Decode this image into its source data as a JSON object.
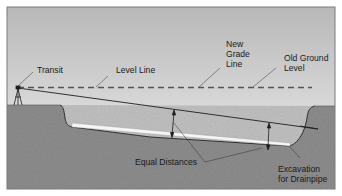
{
  "diagram": {
    "labels": {
      "transit": "Transit",
      "level_line": "Level Line",
      "new_grade_line": [
        "New",
        "Grade",
        "Line"
      ],
      "old_ground_level": [
        "Old Ground",
        "Level"
      ],
      "equal_distances": "Equal Distances",
      "excavation": [
        "Excavation",
        "for Drainpipe"
      ]
    },
    "colors": {
      "sky_top": "#b9b9b9",
      "sky_bottom": "#f1f1f1",
      "ground": "#8e8e8e",
      "backfill": "#bdbdbd",
      "pipe": "#f4f4f4",
      "line": "#1e1e1e",
      "dashed": "#555555",
      "frame": "#7a7a7a"
    }
  }
}
